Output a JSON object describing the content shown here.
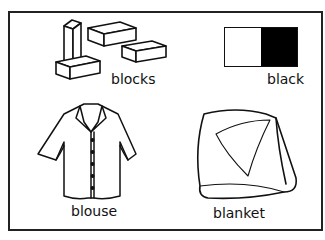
{
  "card": {
    "items": [
      {
        "name": "blocks",
        "label": "blocks"
      },
      {
        "name": "black",
        "label": "black"
      },
      {
        "name": "blouse",
        "label": "blouse"
      },
      {
        "name": "blanket",
        "label": "blanket"
      }
    ]
  },
  "colors": {
    "border": "#222222",
    "swatch_light": "#ffffff",
    "swatch_dark": "#000000"
  }
}
